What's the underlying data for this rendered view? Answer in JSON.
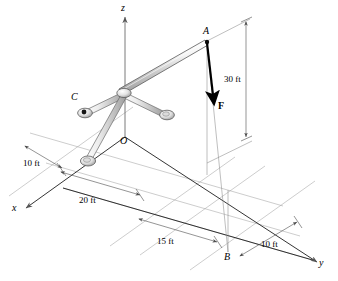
{
  "figure": {
    "type": "engineering-statics-free-body-diagram",
    "axes": [
      {
        "name": "z-axis",
        "label": "z",
        "x": 124,
        "y": 8
      },
      {
        "name": "x-axis",
        "label": "x",
        "x": 14,
        "y": 208
      },
      {
        "name": "y-axis",
        "label": "y",
        "x": 321,
        "y": 264
      }
    ],
    "points": [
      {
        "name": "point-a",
        "label": "A",
        "x": 204,
        "y": 31,
        "px": 207,
        "py": 42
      },
      {
        "name": "point-b",
        "label": "B",
        "x": 225,
        "y": 258,
        "px": 228,
        "py": 252
      },
      {
        "name": "point-c",
        "label": "C",
        "x": 73,
        "y": 97,
        "px": 84,
        "py": 113
      },
      {
        "name": "origin-o",
        "label": "O",
        "x": 122,
        "y": 140,
        "px": 125,
        "py": 137
      }
    ],
    "force": {
      "name": "force-vector-f",
      "label": "F",
      "label_x": 220,
      "label_y": 107,
      "tail_x": 207,
      "tail_y": 44,
      "head_x": 214,
      "head_y": 108
    },
    "dimensions": [
      {
        "name": "dimension-30ft",
        "label": "30 ft",
        "x": 245,
        "y": 79,
        "orientation": "vertical"
      },
      {
        "name": "dimension-10ft-left",
        "label": "10 ft",
        "x": 27,
        "y": 163,
        "orientation": "oblique"
      },
      {
        "name": "dimension-20ft",
        "label": "20 ft",
        "x": 84,
        "y": 200,
        "orientation": "oblique"
      },
      {
        "name": "dimension-15ft",
        "label": "15 ft",
        "x": 161,
        "y": 241,
        "orientation": "oblique"
      },
      {
        "name": "dimension-10ft-right",
        "label": "10 ft",
        "x": 265,
        "y": 244,
        "orientation": "oblique"
      }
    ],
    "colors": {
      "line": "#000000",
      "thin_line": "#6e6e6e",
      "member_stroke": "#555555",
      "member_fill_light": "#f2f2f2",
      "member_fill_mid": "#d2d2d2",
      "member_fill_dark": "#a8a8a8",
      "joint_fill": "#e6e6e6",
      "background": "#ffffff"
    }
  }
}
